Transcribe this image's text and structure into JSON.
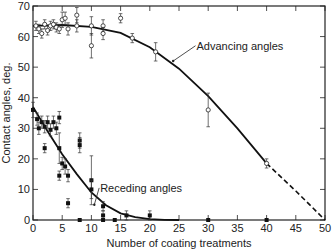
{
  "chart_data": {
    "type": "scatter",
    "title": "",
    "xlabel": "Number of coating treatments",
    "ylabel": "Contact angles, deg.",
    "xlim": [
      0,
      50
    ],
    "ylim": [
      0,
      70
    ],
    "xticks": [
      0,
      5,
      10,
      15,
      20,
      25,
      30,
      35,
      40,
      45,
      50
    ],
    "yticks": [
      0,
      10,
      20,
      30,
      40,
      50,
      60,
      70
    ],
    "grid": false,
    "legend": null,
    "annotations": [
      {
        "text": "Advancing angles",
        "x": 28,
        "y": 57,
        "arrow_to": [
          24,
          52
        ]
      },
      {
        "text": "Receding angles",
        "x": 11.5,
        "y": 10.5,
        "arrow_to": [
          10.5,
          5
        ]
      }
    ],
    "series": [
      {
        "name": "Advancing angles",
        "marker": "open",
        "points": [
          {
            "x": 0.5,
            "y": 63.5,
            "err": 1.5
          },
          {
            "x": 1,
            "y": 62.5,
            "err": 1.5
          },
          {
            "x": 1.5,
            "y": 61,
            "err": 1.5
          },
          {
            "x": 2,
            "y": 64,
            "err": 1.5
          },
          {
            "x": 2.5,
            "y": 62,
            "err": 1.5
          },
          {
            "x": 3,
            "y": 63.5,
            "err": 1.5
          },
          {
            "x": 3.5,
            "y": 64,
            "err": 1.5
          },
          {
            "x": 4,
            "y": 63,
            "err": 1.5
          },
          {
            "x": 4.5,
            "y": 62.5,
            "err": 1.5
          },
          {
            "x": 5,
            "y": 65.5,
            "err": 2.5
          },
          {
            "x": 5.5,
            "y": 66,
            "err": 2.0
          },
          {
            "x": 6,
            "y": 62.5,
            "err": 2.0
          },
          {
            "x": 7.5,
            "y": 67,
            "err": 2.5
          },
          {
            "x": 7.5,
            "y": 63.5,
            "err": 2.0
          },
          {
            "x": 10,
            "y": 63.5,
            "err": 3.0
          },
          {
            "x": 10,
            "y": 57,
            "err": 4.0
          },
          {
            "x": 12,
            "y": 63.5,
            "err": 2.0
          },
          {
            "x": 12,
            "y": 61,
            "err": 2.0
          },
          {
            "x": 15,
            "y": 66,
            "err": 1.5
          },
          {
            "x": 17,
            "y": 59.5,
            "err": 1.5
          },
          {
            "x": 21,
            "y": 55,
            "err": 3.0
          },
          {
            "x": 30,
            "y": 36,
            "err": 5.5
          },
          {
            "x": 40,
            "y": 18.5,
            "err": 1.5
          }
        ],
        "fit_curve": [
          [
            0,
            63.5
          ],
          [
            5,
            63.8
          ],
          [
            10,
            63.2
          ],
          [
            15,
            61.2
          ],
          [
            20,
            56.5
          ],
          [
            25,
            49.5
          ],
          [
            30,
            40.5
          ],
          [
            35,
            30
          ],
          [
            40,
            18.5
          ]
        ],
        "extrapolation": [
          [
            40,
            18.5
          ],
          [
            45,
            9.5
          ],
          [
            50,
            0
          ]
        ]
      },
      {
        "name": "Receding angles",
        "marker": "filled",
        "points": [
          {
            "x": 0,
            "y": 36,
            "err": 2.5
          },
          {
            "x": 0.7,
            "y": 33,
            "err": 2.0
          },
          {
            "x": 1,
            "y": 30,
            "err": 2.0
          },
          {
            "x": 1.5,
            "y": 32,
            "err": 2.0
          },
          {
            "x": 2,
            "y": 30.5,
            "err": 2.0
          },
          {
            "x": 2,
            "y": 23.5,
            "err": 1.5
          },
          {
            "x": 2.5,
            "y": 32,
            "err": 2.0
          },
          {
            "x": 3,
            "y": 29.5,
            "err": 2.0
          },
          {
            "x": 3.5,
            "y": 32,
            "err": 2.0
          },
          {
            "x": 4,
            "y": 30,
            "err": 2.0
          },
          {
            "x": 4.5,
            "y": 33.5,
            "err": 2.0
          },
          {
            "x": 4.5,
            "y": 23.5,
            "err": 5.0
          },
          {
            "x": 4.5,
            "y": 14.5,
            "err": 1.5
          },
          {
            "x": 5,
            "y": 18.5,
            "err": 2.0
          },
          {
            "x": 5.5,
            "y": 17.5,
            "err": 2.5
          },
          {
            "x": 6,
            "y": 14.5,
            "err": 2.0
          },
          {
            "x": 6,
            "y": 5.5,
            "err": 1.5
          },
          {
            "x": 8,
            "y": 26,
            "err": 2.5
          },
          {
            "x": 8,
            "y": 24.5,
            "err": 2.5
          },
          {
            "x": 8,
            "y": 0,
            "err": 0
          },
          {
            "x": 10,
            "y": 13,
            "err": 8.0
          },
          {
            "x": 10,
            "y": 10,
            "err": 3.0
          },
          {
            "x": 12,
            "y": 4.5,
            "err": 1.5
          },
          {
            "x": 12,
            "y": 1.5,
            "err": 1.5
          },
          {
            "x": 12,
            "y": 0,
            "err": 0
          },
          {
            "x": 14,
            "y": 0,
            "err": 0
          },
          {
            "x": 16,
            "y": 1.5,
            "err": 1.5
          },
          {
            "x": 20,
            "y": 1.5,
            "err": 1.5
          },
          {
            "x": 30,
            "y": 0,
            "err": 0
          },
          {
            "x": 40,
            "y": 0,
            "err": 0
          }
        ],
        "fit_curve": [
          [
            0,
            37
          ],
          [
            2.5,
            29
          ],
          [
            5,
            21.5
          ],
          [
            7.5,
            15
          ],
          [
            10,
            9
          ],
          [
            12.5,
            4.8
          ],
          [
            15,
            2.2
          ],
          [
            17.5,
            0.9
          ],
          [
            20,
            0.3
          ],
          [
            22.5,
            0.05
          ],
          [
            25,
            0
          ]
        ]
      }
    ]
  },
  "plot_area": {
    "x0": 33,
    "x1": 325,
    "y0": 220,
    "y1": 6
  }
}
